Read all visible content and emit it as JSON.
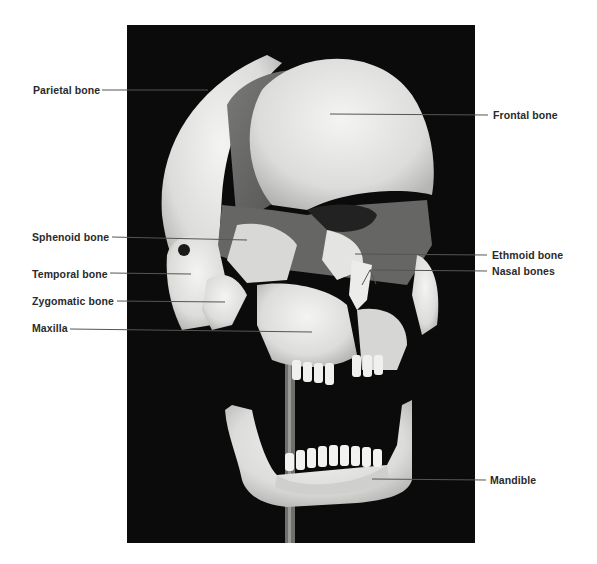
{
  "figure": {
    "colors": {
      "background": "#ffffff",
      "photo_background": "#0b0b0b",
      "bone": "#e8e8e6",
      "label_text": "#2a2a2a",
      "leader_line": "#555555"
    }
  },
  "labels": {
    "left": [
      {
        "id": "parietal",
        "text": "Parietal bone",
        "x": 33,
        "y": 84,
        "line_from": [
          102,
          90
        ],
        "line_to": [
          208,
          90
        ]
      },
      {
        "id": "sphenoid",
        "text": "Sphenoid bone",
        "x": 32,
        "y": 231,
        "line_from": [
          112,
          237
        ],
        "line_to": [
          247,
          240
        ]
      },
      {
        "id": "temporal",
        "text": "Temporal bone",
        "x": 32,
        "y": 268,
        "line_from": [
          110,
          273
        ],
        "line_to": [
          191,
          274
        ]
      },
      {
        "id": "zygomatic",
        "text": "Zygomatic bone",
        "x": 32,
        "y": 295,
        "line_from": [
          117,
          301
        ],
        "line_to": [
          225,
          302
        ]
      },
      {
        "id": "maxilla",
        "text": "Maxilla",
        "x": 32,
        "y": 322,
        "line_from": [
          70,
          329
        ],
        "line_to": [
          312,
          332
        ]
      }
    ],
    "right": [
      {
        "id": "frontal",
        "text": "Frontal bone",
        "x": 493,
        "y": 109,
        "line_from": [
          330,
          114
        ],
        "line_to": [
          488,
          115
        ]
      },
      {
        "id": "ethmoid",
        "text": "Ethmoid bone",
        "x": 492,
        "y": 249,
        "line_from": [
          355,
          254
        ],
        "line_to": [
          487,
          255
        ]
      },
      {
        "id": "nasal",
        "text": "Nasal bones",
        "x": 492,
        "y": 265,
        "line_from": [
          370,
          270
        ],
        "line_to": [
          487,
          271
        ]
      },
      {
        "id": "mandible",
        "text": "Mandible",
        "x": 490,
        "y": 474,
        "line_from": [
          372,
          479
        ],
        "line_to": [
          486,
          480
        ]
      }
    ]
  }
}
